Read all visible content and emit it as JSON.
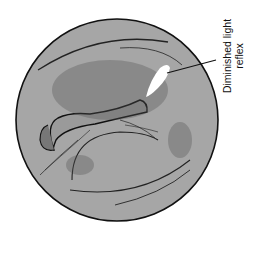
{
  "figure": {
    "colors": {
      "membrane_fill": "#a6a6a6",
      "outline": "#111111",
      "light_reflex": "#ffffff",
      "background": "#ffffff"
    },
    "annotations": [
      {
        "line1": "Diminished light",
        "line2": "reflex"
      }
    ]
  }
}
